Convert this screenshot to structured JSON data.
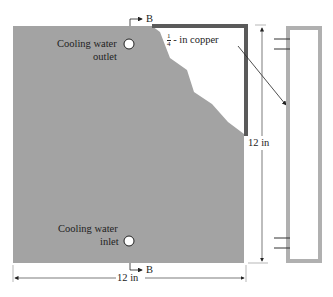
{
  "diagram": {
    "section_marker": "B",
    "outlet_label_line1": "Cooling water",
    "outlet_label_line2": "outlet",
    "inlet_label_line1": "Cooling water",
    "inlet_label_line2": "inlet",
    "copper_label_frac_num": "1",
    "copper_label_frac_den": "4",
    "copper_label_text": "- in copper",
    "height_dimension": "12 in",
    "width_dimension": "12 in"
  },
  "colors": {
    "plate": "#a3a3a3",
    "copper_edge": "#5a5a5a",
    "elevation": "#b0b0b0",
    "line": "#333333"
  }
}
